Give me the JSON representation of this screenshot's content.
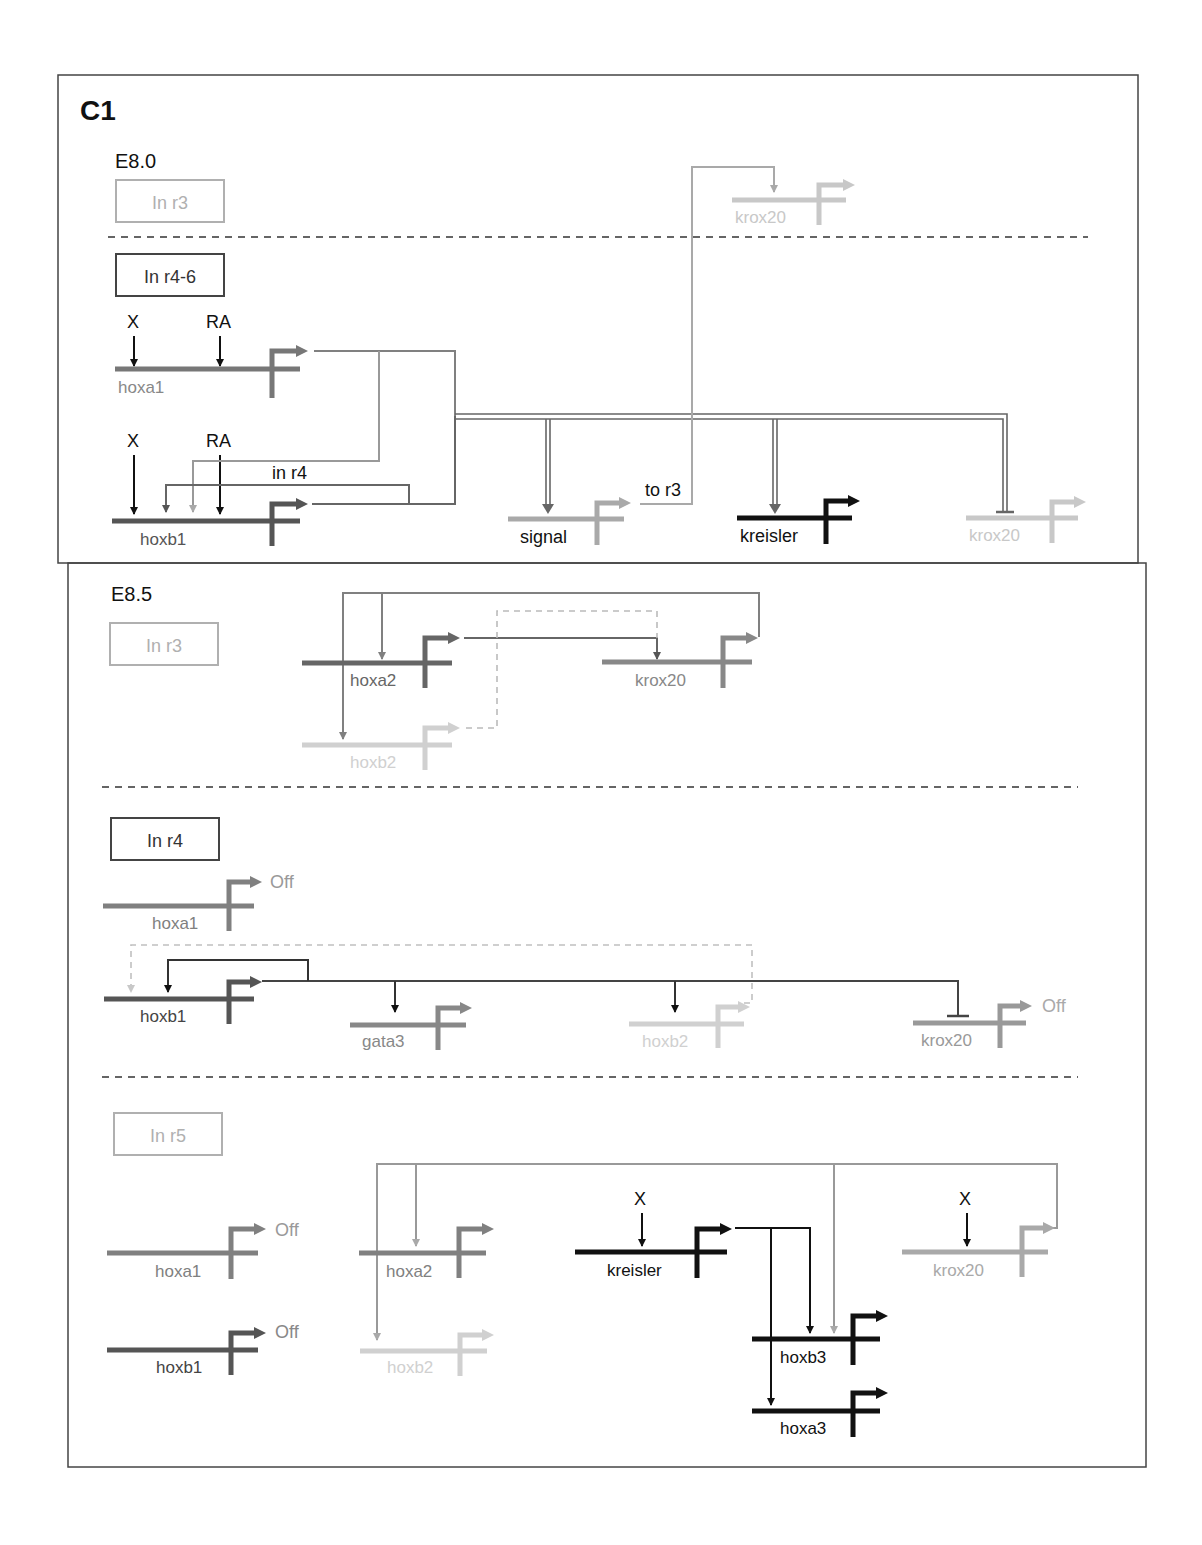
{
  "panel": {
    "label": "C1"
  },
  "colors": {
    "black": "#111111",
    "dark": "#555555",
    "mid": "#808080",
    "light": "#a9a9a9",
    "faint": "#c8c8c8",
    "frame": "#444444"
  },
  "stages": [
    {
      "name": "E8.0",
      "regions": [
        {
          "label": "In r3",
          "tone": "light",
          "genes": [
            {
              "id": "e80_r3_krox20",
              "name": "krox20",
              "tone": "faint"
            }
          ]
        },
        {
          "label": "In r4-6",
          "tone": "dark",
          "inputs": [
            "X",
            "RA",
            "X",
            "RA"
          ],
          "annotations": [
            "in r4",
            "to r3"
          ],
          "genes": [
            {
              "id": "e80_hoxa1",
              "name": "hoxa1",
              "tone": "mid"
            },
            {
              "id": "e80_hoxb1",
              "name": "hoxb1",
              "tone": "dark"
            },
            {
              "id": "e80_signal",
              "name": "signal",
              "tone": "light"
            },
            {
              "id": "e80_kreisler",
              "name": "kreisler",
              "tone": "black"
            },
            {
              "id": "e80_krox20",
              "name": "krox20",
              "tone": "faint"
            }
          ]
        }
      ]
    },
    {
      "name": "E8.5",
      "regions": [
        {
          "label": "In r3",
          "tone": "light",
          "genes": [
            {
              "id": "e85_r3_hoxa2",
              "name": "hoxa2",
              "tone": "dark"
            },
            {
              "id": "e85_r3_krox20",
              "name": "krox20",
              "tone": "mid"
            },
            {
              "id": "e85_r3_hoxb2",
              "name": "hoxb2",
              "tone": "faint"
            }
          ]
        },
        {
          "label": "In r4",
          "tone": "dark",
          "genes": [
            {
              "id": "e85_r4_hoxa1",
              "name": "hoxa1",
              "tone": "mid",
              "status": "Off"
            },
            {
              "id": "e85_r4_hoxb1",
              "name": "hoxb1",
              "tone": "dark"
            },
            {
              "id": "e85_r4_gata3",
              "name": "gata3",
              "tone": "mid"
            },
            {
              "id": "e85_r4_hoxb2",
              "name": "hoxb2",
              "tone": "faint"
            },
            {
              "id": "e85_r4_krox20",
              "name": "krox20",
              "tone": "mid",
              "status": "Off"
            }
          ]
        },
        {
          "label": "In r5",
          "tone": "light",
          "inputs": [
            "X",
            "X"
          ],
          "genes": [
            {
              "id": "e85_r5_hoxa1",
              "name": "hoxa1",
              "tone": "mid",
              "status": "Off"
            },
            {
              "id": "e85_r5_hoxb1",
              "name": "hoxb1",
              "tone": "dark",
              "status": "Off"
            },
            {
              "id": "e85_r5_hoxa2",
              "name": "hoxa2",
              "tone": "mid"
            },
            {
              "id": "e85_r5_hoxb2",
              "name": "hoxb2",
              "tone": "faint"
            },
            {
              "id": "e85_r5_kreisler",
              "name": "kreisler",
              "tone": "black"
            },
            {
              "id": "e85_r5_krox20",
              "name": "krox20",
              "tone": "light"
            },
            {
              "id": "e85_r5_hoxb3",
              "name": "hoxb3",
              "tone": "black"
            },
            {
              "id": "e85_r5_hoxa3",
              "name": "hoxa3",
              "tone": "black"
            }
          ]
        }
      ]
    }
  ]
}
